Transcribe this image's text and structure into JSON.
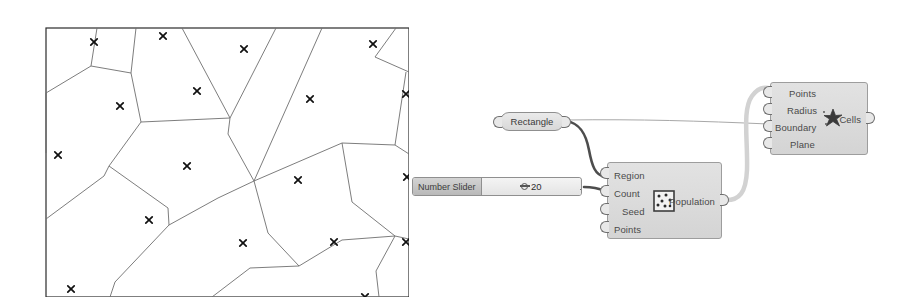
{
  "diagram": {
    "frame": {
      "stroke": "#2b2b2b",
      "fill": "#ffffff"
    },
    "cell_stroke": "#6e6e6e",
    "point_marker": "x-marker",
    "point_count": 20,
    "points": [
      [
        62,
        28
      ],
      [
        131,
        22
      ],
      [
        212,
        35
      ],
      [
        278,
        85
      ],
      [
        341,
        30
      ],
      [
        374,
        80
      ],
      [
        26,
        141
      ],
      [
        155,
        152
      ],
      [
        266,
        166
      ],
      [
        375,
        163
      ],
      [
        117,
        206
      ],
      [
        211,
        229
      ],
      [
        302,
        228
      ],
      [
        374,
        228
      ],
      [
        39,
        275
      ],
      [
        150,
        292
      ],
      [
        248,
        297
      ],
      [
        333,
        283
      ],
      [
        88,
        92
      ],
      [
        165,
        77
      ]
    ],
    "edges": [
      [
        [
          65,
          14
        ],
        [
          59,
          52
        ],
        [
          14,
          79
        ],
        [
          14,
          139
        ]
      ],
      [
        [
          59,
          52
        ],
        [
          99,
          59
        ],
        [
          109,
          108
        ],
        [
          77,
          152
        ]
      ],
      [
        [
          99,
          59
        ],
        [
          104,
          14
        ]
      ],
      [
        [
          109,
          108
        ],
        [
          198,
          104
        ]
      ],
      [
        [
          198,
          104
        ],
        [
          150,
          14
        ]
      ],
      [
        [
          198,
          104
        ],
        [
          196,
          120
        ],
        [
          222,
          167
        ]
      ],
      [
        [
          198,
          104
        ],
        [
          244,
          14
        ]
      ],
      [
        [
          222,
          167
        ],
        [
          290,
          14
        ]
      ],
      [
        [
          222,
          167
        ],
        [
          310,
          129
        ],
        [
          363,
          131
        ]
      ],
      [
        [
          363,
          131
        ],
        [
          374,
          58
        ]
      ],
      [
        [
          363,
          131
        ],
        [
          377,
          140
        ]
      ],
      [
        [
          377,
          58
        ],
        [
          343,
          43
        ],
        [
          364,
          14
        ]
      ],
      [
        [
          77,
          152
        ],
        [
          72,
          162
        ],
        [
          14,
          205
        ]
      ],
      [
        [
          77,
          152
        ],
        [
          136,
          194
        ],
        [
          137,
          211
        ]
      ],
      [
        [
          137,
          211
        ],
        [
          83,
          268
        ],
        [
          78,
          283
        ]
      ],
      [
        [
          137,
          211
        ],
        [
          186,
          184
        ],
        [
          222,
          167
        ]
      ],
      [
        [
          222,
          167
        ],
        [
          236,
          219
        ],
        [
          267,
          252
        ]
      ],
      [
        [
          267,
          252
        ],
        [
          310,
          226
        ],
        [
          363,
          222
        ]
      ],
      [
        [
          363,
          222
        ],
        [
          377,
          225
        ]
      ],
      [
        [
          363,
          222
        ],
        [
          320,
          188
        ],
        [
          310,
          129
        ]
      ],
      [
        [
          267,
          252
        ],
        [
          218,
          254
        ],
        [
          180,
          283
        ]
      ],
      [
        [
          363,
          222
        ],
        [
          344,
          257
        ],
        [
          347,
          283
        ]
      ]
    ]
  },
  "graph": {
    "rectangle_node": {
      "label": "Rectangle",
      "x": 100,
      "y": 112,
      "w": 64,
      "h": 19,
      "input_port": "rectangle-input-port",
      "output_port": "rectangle-output-port"
    },
    "number_slider": {
      "name_label": "Number Slider",
      "value": "20",
      "x": 12,
      "y": 177,
      "w": 170,
      "h": 19,
      "grip_icon": "slider-grip-icon",
      "output_port": "slider-output-port"
    },
    "population_node": {
      "title": "Population",
      "icon": "population-scatter-icon",
      "x": 207,
      "y": 162,
      "w": 115,
      "h": 77,
      "inputs": [
        "Region",
        "Count",
        "Seed",
        "Points"
      ],
      "outputs": [
        "Population"
      ]
    },
    "cells_node": {
      "title": "Cells",
      "icon": "voronoi-star-icon",
      "x": 370,
      "y": 82,
      "w": 98,
      "h": 73,
      "inputs": [
        "Points",
        "Radius",
        "Boundary",
        "Plane"
      ],
      "outputs": [
        "Cells"
      ]
    },
    "wires": [
      {
        "name": "rectangle-to-region",
        "from": "rectangle-output",
        "to": "population-region-input",
        "style": "thick",
        "path": "M 166 121 C 180 123, 186 134, 189 150 C 192 166, 195 175, 205 177"
      },
      {
        "name": "rectangle-to-boundary",
        "from": "rectangle-output",
        "to": "cells-boundary-input",
        "style": "thin",
        "path": "M 166 120 C 240 119, 300 121, 368 124"
      },
      {
        "name": "slider-to-count",
        "from": "slider-output",
        "to": "population-count-input",
        "style": "thick",
        "path": "M 184 187 C 192 187, 198 188, 205 191"
      },
      {
        "name": "population-to-points",
        "from": "population-output",
        "to": "cells-points-input",
        "style": "thick-light",
        "path": "M 324 200 C 340 201, 346 192, 347 170 C 348 140, 342 110, 352 96 C 358 88, 363 87, 368 88"
      }
    ],
    "wire_colors": {
      "thick": "#4d4d4d",
      "thin": "#a8a8a8",
      "thick_light": "#d2d2d2"
    }
  }
}
